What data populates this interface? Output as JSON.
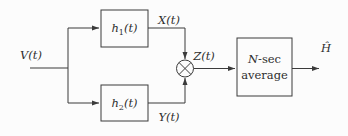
{
  "diagram": {
    "input_label": "V(t)",
    "x_label": "X(t)",
    "y_label": "Y(t)",
    "z_label": "Z(t)",
    "output_label": "Ĥ",
    "h1_block": {
      "base": "h",
      "sub": "1",
      "arg": "(t)"
    },
    "h2_block": {
      "base": "h",
      "sub": "2",
      "arg": "(t)"
    },
    "average_block": {
      "line1_var": "N",
      "line1_rest": "-sec",
      "line2": "average"
    },
    "multiplier": "circled-times",
    "colors": {
      "line": "#3b3b3b",
      "text": "#2e2e2e",
      "background": "#fcfcfc"
    }
  }
}
